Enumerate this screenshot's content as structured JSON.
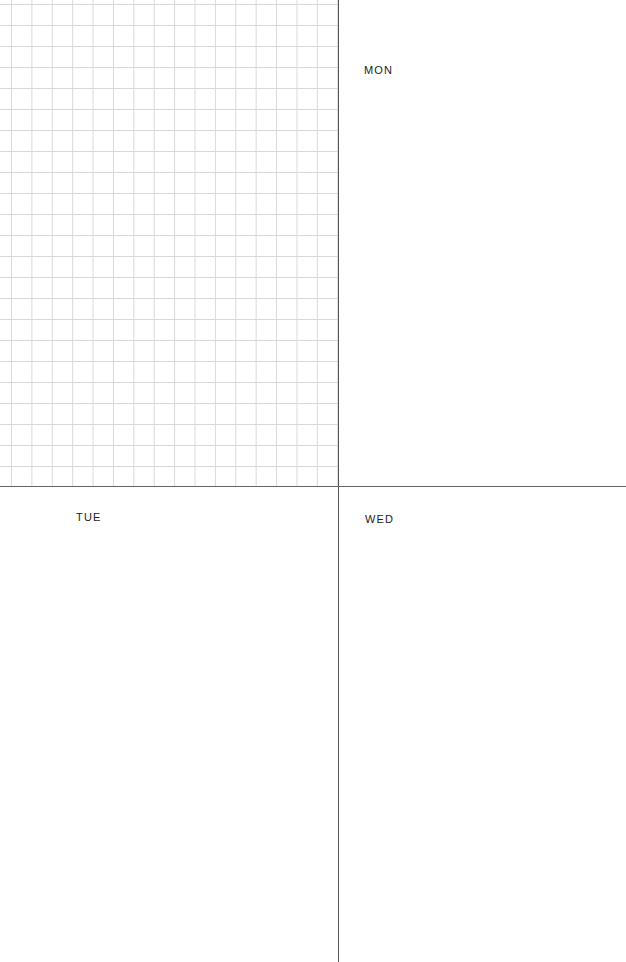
{
  "planner": {
    "notes_panel": {
      "style": "grid"
    },
    "days": [
      {
        "label": "MON"
      },
      {
        "label": "TUE"
      },
      {
        "label": "WED"
      }
    ]
  },
  "colors": {
    "grid_line": "#d9d9d9",
    "divider": "#555555",
    "text": "#222222",
    "background": "#ffffff"
  }
}
